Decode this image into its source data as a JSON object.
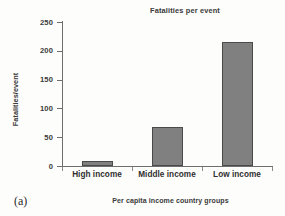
{
  "figure": {
    "label": "(a)"
  },
  "chart_data": {
    "type": "bar",
    "title": "Fatalities per event",
    "xlabel": "Per capita income country groups",
    "ylabel": "Fatalities/event",
    "categories": [
      "High income",
      "Middle income",
      "Low income"
    ],
    "values": [
      9,
      67,
      215
    ],
    "ylim": [
      0,
      250
    ],
    "yticks": [
      0,
      50,
      100,
      150,
      200,
      250
    ],
    "ytick_labels": [
      "0",
      "50",
      "100",
      "150",
      "200",
      "250"
    ],
    "grid": false,
    "legend": "none",
    "bar_color": "#808080",
    "bar_edge_color": "#4a4a4a",
    "axis_color": "#6e6e6e",
    "background_color": "#fdfdfc"
  }
}
